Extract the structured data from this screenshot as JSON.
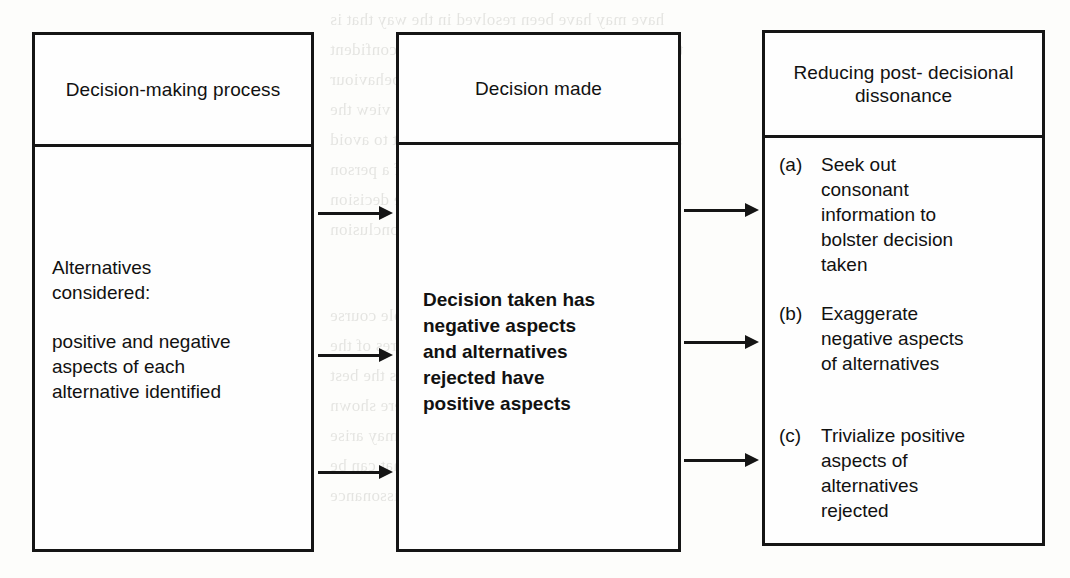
{
  "figure": {
    "columns": [
      {
        "id": "decision-making-process",
        "header": "Decision-making\nprocess",
        "paragraphs": [
          "Alternatives\nconsidered:",
          "positive and negative\naspects of each\nalternative identified"
        ]
      },
      {
        "id": "decision-made",
        "header": "Decision made",
        "paragraphs": [
          "Decision taken has\nnegative aspects\nand alternatives\nrejected have\npositive aspects"
        ]
      },
      {
        "id": "reducing-post-decisional-dissonance",
        "header": "Reducing post-\ndecisional\ndissonance",
        "items": [
          {
            "marker": "(a)",
            "text": "Seek out\nconsonant\ninformation to\nbolster decision\ntaken"
          },
          {
            "marker": "(b)",
            "text": "Exaggerate\nnegative aspects\nof alternatives"
          },
          {
            "marker": "(c)",
            "text": "Trivialize positive\naspects of\nalternatives\nrejected"
          }
        ]
      }
    ],
    "arrows": [
      {
        "id": "arrow-1-to-2-a",
        "from": "decision-making-process",
        "to": "decision-made"
      },
      {
        "id": "arrow-1-to-2-b",
        "from": "decision-making-process",
        "to": "decision-made"
      },
      {
        "id": "arrow-1-to-2-c",
        "from": "decision-making-process",
        "to": "decision-made"
      },
      {
        "id": "arrow-2-to-3-a",
        "from": "decision-made",
        "to": "reducing-post-decisional-dissonance"
      },
      {
        "id": "arrow-2-to-3-b",
        "from": "decision-made",
        "to": "reducing-post-decisional-dissonance"
      },
      {
        "id": "arrow-2-to-3-c",
        "from": "decision-made",
        "to": "reducing-post-decisional-dissonance"
      }
    ],
    "colors": {
      "stroke": "#151515",
      "fill": "#fefefe",
      "page": "#fdfdfb"
    }
  },
  "background_bleed": {
    "lines": [
      "have may have been resolved in the way that is",
      "thing is based on our being a happy and confident",
      "our cognitive dissonance it makes our behaviour",
      "once more and the way in which we view the",
      "same approach may be the way we adopt to avoid",
      "it is important to the self-esteem of a person",
      "attitudes in a way that will justify the decision",
      "the alternatives we may come to the conclusion",
      "that the choice made is the only possible course",
      "we may decide that the positive features of the",
      "alternatives rejected are by no means the best",
      "aspects and the way in which they were shown",
      "in relation to the possibility that may arise",
      "There are a number of possible ways that can be",
      "used by the person to reduce the dissonance"
    ]
  }
}
